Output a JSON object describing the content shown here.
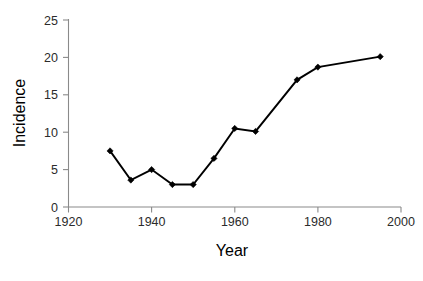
{
  "chart_data": {
    "type": "line",
    "title": "",
    "xlabel": "Year",
    "ylabel": "Incidence",
    "xlim": [
      1920,
      2000
    ],
    "ylim": [
      0,
      25
    ],
    "xticks": [
      1920,
      1940,
      1960,
      1980,
      2000
    ],
    "yticks": [
      0,
      5,
      10,
      15,
      20,
      25
    ],
    "grid": false,
    "legend": "none",
    "marker": "diamond",
    "line_color": "#000000",
    "marker_color": "#000000",
    "background": "#ffffff",
    "axis_color": "#8a8a8a",
    "x": [
      1930,
      1935,
      1940,
      1945,
      1950,
      1955,
      1960,
      1965,
      1975,
      1980,
      1995
    ],
    "values": [
      7.5,
      3.6,
      5.0,
      3.0,
      3.0,
      6.5,
      10.5,
      10.1,
      17.0,
      18.7,
      20.1
    ],
    "series": [
      {
        "name": "Incidence",
        "points": [
          {
            "x": 1930,
            "y": 7.5
          },
          {
            "x": 1935,
            "y": 3.6
          },
          {
            "x": 1940,
            "y": 5.0
          },
          {
            "x": 1945,
            "y": 3.0
          },
          {
            "x": 1950,
            "y": 3.0
          },
          {
            "x": 1955,
            "y": 6.5
          },
          {
            "x": 1960,
            "y": 10.5
          },
          {
            "x": 1965,
            "y": 10.1
          },
          {
            "x": 1975,
            "y": 17.0
          },
          {
            "x": 1980,
            "y": 18.7
          },
          {
            "x": 1995,
            "y": 20.1
          }
        ]
      }
    ]
  },
  "labels": {
    "y_0": "0",
    "y_5": "5",
    "y_10": "10",
    "y_15": "15",
    "y_20": "20",
    "y_25": "25",
    "x_1920": "1920",
    "x_1940": "1940",
    "x_1960": "1960",
    "x_1980": "1980",
    "x_2000": "2000",
    "y_title": "Incidence",
    "x_title": "Year"
  }
}
